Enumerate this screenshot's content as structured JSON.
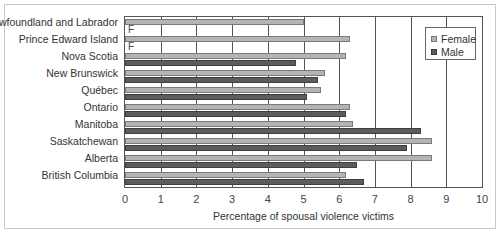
{
  "chart_data": {
    "type": "bar",
    "orientation": "horizontal",
    "title": "",
    "xlabel": "Percentage of spousal violence victims",
    "ylabel": "",
    "xlim": [
      0,
      10
    ],
    "x_ticks": [
      "0",
      "1",
      "2",
      "3",
      "4",
      "5",
      "6",
      "7",
      "8",
      "9",
      "10"
    ],
    "grid": "vertical lines at integer ticks",
    "legend_position": "top-right inside plot",
    "categories": [
      "Newfoundland and Labrador",
      "Prince Edward Island",
      "Nova Scotia",
      "New Brunswick",
      "Québec",
      "Ontario",
      "Manitoba",
      "Saskatchewan",
      "Alberta",
      "British Columbia"
    ],
    "series": [
      {
        "name": "Female",
        "color": "#b4b4b4",
        "values": [
          5.0,
          6.3,
          6.2,
          5.6,
          5.5,
          6.3,
          6.4,
          8.6,
          8.6,
          6.2
        ]
      },
      {
        "name": "Male",
        "color": "#5c5c5c",
        "values": [
          null,
          null,
          4.8,
          5.4,
          5.1,
          6.2,
          8.3,
          7.9,
          6.5,
          6.7
        ]
      }
    ],
    "annotations": [
      {
        "category": "Newfoundland and Labrador",
        "series": "Male",
        "text": "F"
      },
      {
        "category": "Prince Edward Island",
        "series": "Male",
        "text": "F"
      }
    ]
  },
  "legend": {
    "female": "Female",
    "male": "Male"
  },
  "suppressed_marker": "F"
}
